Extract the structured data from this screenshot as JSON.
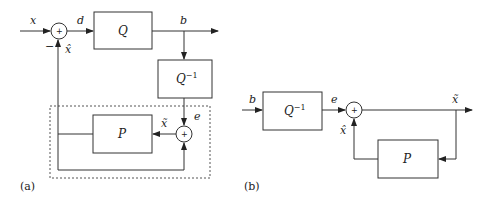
{
  "diagram_a": {
    "caption": "(a)",
    "labels": {
      "input": "x",
      "difference": "d",
      "output": "b",
      "error": "e",
      "prediction": "x̂",
      "reconstruction": "x̃",
      "minus_sign": "−"
    },
    "blocks": {
      "quantizer": "Q",
      "inverse_quantizer_base": "Q",
      "inverse_quantizer_exp": "−1",
      "predictor": "P"
    },
    "sum_symbol": "+"
  },
  "diagram_b": {
    "caption": "(b)",
    "labels": {
      "input": "b",
      "error": "e",
      "output": "x̃",
      "prediction": "x̂"
    },
    "blocks": {
      "inverse_quantizer_base": "Q",
      "inverse_quantizer_exp": "−1",
      "predictor": "P"
    },
    "sum_symbol": "+"
  }
}
